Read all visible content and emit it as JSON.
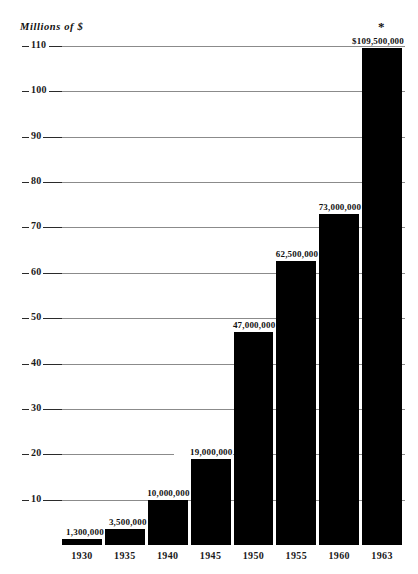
{
  "chart_data": {
    "type": "bar",
    "title": "",
    "subtitle": "",
    "unit_caption": "Millions of $",
    "xlabel": "",
    "ylabel": "Millions of $",
    "categories": [
      "1930",
      "1935",
      "1940",
      "1945",
      "1950",
      "1955",
      "1960",
      "1963"
    ],
    "values": [
      1.3,
      3.5,
      10,
      19,
      47,
      62.5,
      73,
      109.5
    ],
    "value_labels": [
      "1,300,000",
      "3,500,000",
      "10,000,000",
      "19,000,000",
      "47,000,000",
      "62,500,000",
      "73,000,000",
      "$109,500,000"
    ],
    "ylim": [
      0,
      110
    ],
    "ytick_values": [
      10,
      20,
      30,
      40,
      50,
      60,
      70,
      80,
      90,
      100,
      110
    ],
    "ytick_labels": [
      "10",
      "20",
      "30",
      "40",
      "50",
      "60",
      "70",
      "80",
      "90",
      "100",
      "110"
    ],
    "grid": true,
    "legend": "none",
    "annotations": [
      {
        "name": "asterisk",
        "text": "*",
        "attached_to": "1963"
      }
    ],
    "colors": {
      "bar": "#000000",
      "gridline": "#8b8b8b",
      "text": "#111111",
      "background": "#ffffff"
    }
  }
}
